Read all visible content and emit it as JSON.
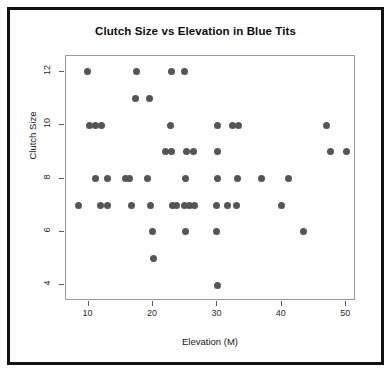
{
  "figure": {
    "background_color": "#ffffff",
    "frame_color": "#121212",
    "panel_border_color": "#9a9a9a",
    "point_color": "#555555"
  },
  "chart_data": {
    "type": "scatter",
    "title": "Clutch Size vs Elevation in Blue Tits",
    "xlabel": "Elevation (M)",
    "ylabel": "Clutch Size",
    "xlim": [
      6.5,
      51.5
    ],
    "ylim": [
      3.4,
      12.6
    ],
    "xticks": [
      10,
      20,
      30,
      40,
      50
    ],
    "xticklabels": [
      "10",
      "20",
      "30",
      "40",
      "50"
    ],
    "yticks": [
      4,
      6,
      8,
      10,
      12
    ],
    "yticklabels": [
      "4",
      "6",
      "8",
      "10",
      "12"
    ],
    "grid": false,
    "legend": null,
    "marker": "filled-circle",
    "points": [
      {
        "x": 9.8,
        "y": 12
      },
      {
        "x": 17.4,
        "y": 12
      },
      {
        "x": 22.8,
        "y": 12
      },
      {
        "x": 24.9,
        "y": 12
      },
      {
        "x": 17.3,
        "y": 11
      },
      {
        "x": 19.5,
        "y": 11
      },
      {
        "x": 10.1,
        "y": 10
      },
      {
        "x": 11.0,
        "y": 10
      },
      {
        "x": 12.0,
        "y": 10
      },
      {
        "x": 22.7,
        "y": 10
      },
      {
        "x": 30.0,
        "y": 10
      },
      {
        "x": 32.3,
        "y": 10
      },
      {
        "x": 33.3,
        "y": 10
      },
      {
        "x": 46.9,
        "y": 10
      },
      {
        "x": 22.0,
        "y": 9
      },
      {
        "x": 22.9,
        "y": 9
      },
      {
        "x": 25.2,
        "y": 9
      },
      {
        "x": 26.3,
        "y": 9
      },
      {
        "x": 30.0,
        "y": 9
      },
      {
        "x": 47.6,
        "y": 9
      },
      {
        "x": 50.1,
        "y": 9
      },
      {
        "x": 11.1,
        "y": 8
      },
      {
        "x": 13.0,
        "y": 8
      },
      {
        "x": 15.7,
        "y": 8
      },
      {
        "x": 16.4,
        "y": 8
      },
      {
        "x": 19.2,
        "y": 8
      },
      {
        "x": 25.1,
        "y": 8
      },
      {
        "x": 30.0,
        "y": 8
      },
      {
        "x": 33.1,
        "y": 8
      },
      {
        "x": 36.8,
        "y": 8
      },
      {
        "x": 41.1,
        "y": 8
      },
      {
        "x": 8.4,
        "y": 7
      },
      {
        "x": 11.8,
        "y": 7
      },
      {
        "x": 12.9,
        "y": 7
      },
      {
        "x": 16.7,
        "y": 7
      },
      {
        "x": 19.6,
        "y": 7
      },
      {
        "x": 23.0,
        "y": 7
      },
      {
        "x": 23.7,
        "y": 7
      },
      {
        "x": 24.9,
        "y": 7
      },
      {
        "x": 25.7,
        "y": 7
      },
      {
        "x": 26.5,
        "y": 7
      },
      {
        "x": 29.9,
        "y": 7
      },
      {
        "x": 31.6,
        "y": 7
      },
      {
        "x": 33.0,
        "y": 7
      },
      {
        "x": 40.0,
        "y": 7
      },
      {
        "x": 19.9,
        "y": 6
      },
      {
        "x": 25.0,
        "y": 6
      },
      {
        "x": 29.9,
        "y": 6
      },
      {
        "x": 43.3,
        "y": 6
      },
      {
        "x": 20.0,
        "y": 5
      },
      {
        "x": 30.0,
        "y": 4
      }
    ]
  }
}
